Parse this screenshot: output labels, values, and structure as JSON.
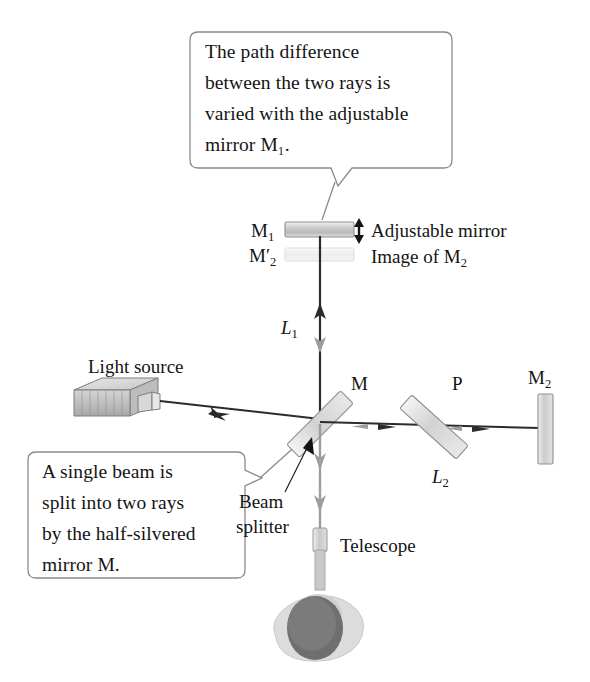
{
  "figure": {
    "kind": "michelson-interferometer-diagram",
    "background_color": "#ffffff",
    "ink_color": "#141414",
    "beam_dark_color": "#2b2b2b",
    "beam_gray_color": "#9b9b9b",
    "mirror_fill_light": "#d9d9d9",
    "mirror_fill_ghost": "#ededed",
    "callout_border_color": "#8a8a8a"
  },
  "callouts": [
    {
      "id": "top-callout",
      "lines": [
        "The path difference",
        "between the two rays is",
        "varied with the adjustable",
        "mirror M₁."
      ],
      "full_text": "The path difference between the two rays is varied with the adjustable mirror M1.",
      "points_to": "M1"
    },
    {
      "id": "bottom-callout",
      "lines": [
        "A single beam is",
        "split into two rays",
        "by the half-silvered",
        "mirror M."
      ],
      "full_text": "A single beam is split into two rays by the half-silvered mirror M.",
      "points_to": "beam-splitter"
    }
  ],
  "labels": {
    "m1": "M",
    "m1_sub": "1",
    "m2prime": "M",
    "m2prime_sub": "2",
    "m2prime_prime": "′",
    "m2": "M",
    "m2_sub": "2",
    "m": "M",
    "p": "P",
    "l1": "L",
    "l1_sub": "1",
    "l2": "L",
    "l2_sub": "2",
    "adjustable_mirror": "Adjustable mirror",
    "image_of": "Image of M",
    "image_of_sub": "2",
    "light_source": "Light source",
    "beam_splitter_line1": "Beam",
    "beam_splitter_line2": "splitter",
    "telescope": "Telescope"
  },
  "components": [
    {
      "name": "adjustable-mirror-M1",
      "label": "M1",
      "note": "Adjustable mirror"
    },
    {
      "name": "image-mirror-M2-prime",
      "label": "M2′",
      "note": "Image of M2"
    },
    {
      "name": "beam-splitter-M",
      "label": "M",
      "note": "half-silvered mirror"
    },
    {
      "name": "compensator-plate-P",
      "label": "P",
      "note": "compensator plate"
    },
    {
      "name": "fixed-mirror-M2",
      "label": "M2",
      "note": "fixed mirror"
    },
    {
      "name": "light-source",
      "label": "Light source",
      "note": "emitter box"
    },
    {
      "name": "telescope",
      "label": "Telescope",
      "note": "observer eyepiece"
    },
    {
      "name": "arm-length-L1",
      "label": "L1",
      "note": "vertical arm"
    },
    {
      "name": "arm-length-L2",
      "label": "L2",
      "note": "horizontal arm"
    }
  ]
}
